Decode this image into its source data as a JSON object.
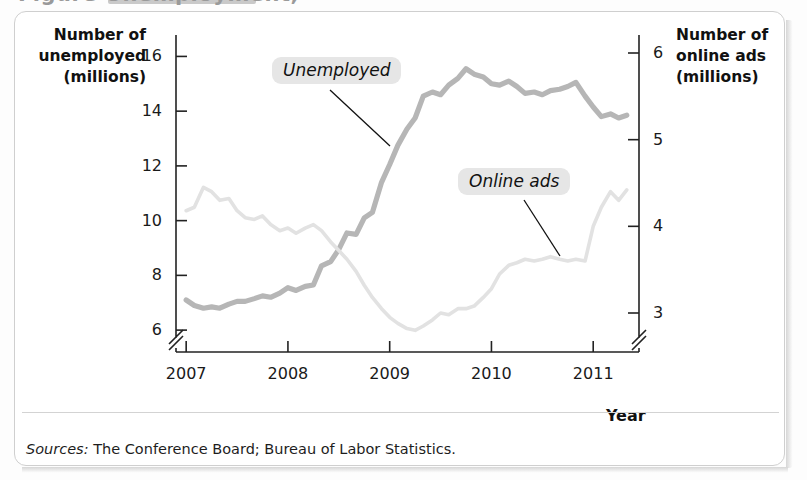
{
  "figure": {
    "cutoff_title": "Figure  Unemployment,",
    "source_label": "Sources:",
    "source_text": "The Conference Board; Bureau of Labor Statistics."
  },
  "chart_data": {
    "type": "line",
    "title": "",
    "xlabel": "Year",
    "ylabel": "Number of unemployed (millions)",
    "y2label": "Number of online ads (millions)",
    "grid": false,
    "legend_position": "inline-callouts",
    "xlim": [
      2006.9,
      2011.45
    ],
    "ylim": [
      5.2,
      16.6
    ],
    "y2lim": [
      2.55,
      6.15
    ],
    "xticks": [
      2007,
      2008,
      2009,
      2010,
      2011
    ],
    "xtick_labels": [
      "2007",
      "2008",
      "2009",
      "2010",
      "2011"
    ],
    "yticks": [
      6,
      8,
      10,
      12,
      14,
      16
    ],
    "ytick_labels": [
      "6",
      "8",
      "10",
      "12",
      "14",
      "16"
    ],
    "y2ticks": [
      3,
      4,
      5,
      6
    ],
    "y2tick_labels": [
      "3",
      "4",
      "5",
      "6"
    ],
    "axis_break_left": true,
    "axis_break_right": true,
    "axis_break_x": true,
    "series": [
      {
        "name": "Unemployed",
        "axis": "left",
        "color": "#b6b6b6",
        "label_text": "Unemployed",
        "x": [
          2007.0,
          2007.08,
          2007.17,
          2007.25,
          2007.33,
          2007.42,
          2007.5,
          2007.58,
          2007.67,
          2007.75,
          2007.83,
          2007.92,
          2008.0,
          2008.08,
          2008.17,
          2008.25,
          2008.33,
          2008.42,
          2008.5,
          2008.58,
          2008.67,
          2008.75,
          2008.83,
          2008.92,
          2009.0,
          2009.08,
          2009.17,
          2009.25,
          2009.33,
          2009.42,
          2009.5,
          2009.58,
          2009.67,
          2009.75,
          2009.83,
          2009.92,
          2010.0,
          2010.08,
          2010.17,
          2010.25,
          2010.33,
          2010.42,
          2010.5,
          2010.58,
          2010.67,
          2010.75,
          2010.83,
          2010.92,
          2011.0,
          2011.08,
          2011.17,
          2011.25,
          2011.33
        ],
        "y": [
          7.1,
          6.9,
          6.8,
          6.85,
          6.8,
          6.95,
          7.05,
          7.05,
          7.15,
          7.25,
          7.2,
          7.35,
          7.55,
          7.45,
          7.6,
          7.65,
          8.35,
          8.5,
          8.95,
          9.55,
          9.5,
          10.1,
          10.3,
          11.4,
          12.05,
          12.75,
          13.35,
          13.75,
          14.55,
          14.7,
          14.6,
          14.95,
          15.2,
          15.55,
          15.35,
          15.25,
          15.0,
          14.95,
          15.1,
          14.9,
          14.65,
          14.7,
          14.6,
          14.75,
          14.8,
          14.9,
          15.05,
          14.55,
          14.15,
          13.8,
          13.9,
          13.75,
          13.85
        ]
      },
      {
        "name": "Online ads",
        "axis": "right",
        "color": "#e2e2e2",
        "label_text": "Online ads",
        "x": [
          2007.0,
          2007.08,
          2007.17,
          2007.25,
          2007.33,
          2007.42,
          2007.5,
          2007.58,
          2007.67,
          2007.75,
          2007.83,
          2007.92,
          2008.0,
          2008.08,
          2008.17,
          2008.25,
          2008.33,
          2008.42,
          2008.5,
          2008.58,
          2008.67,
          2008.75,
          2008.83,
          2008.92,
          2009.0,
          2009.08,
          2009.17,
          2009.25,
          2009.33,
          2009.42,
          2009.5,
          2009.58,
          2009.67,
          2009.75,
          2009.83,
          2009.92,
          2010.0,
          2010.08,
          2010.17,
          2010.25,
          2010.33,
          2010.42,
          2010.5,
          2010.58,
          2010.67,
          2010.75,
          2010.83,
          2010.92,
          2011.0,
          2011.08,
          2011.17,
          2011.25,
          2011.33
        ],
        "y": [
          4.18,
          4.22,
          4.45,
          4.4,
          4.3,
          4.32,
          4.18,
          4.1,
          4.08,
          4.12,
          4.02,
          3.95,
          3.98,
          3.92,
          3.98,
          4.02,
          3.95,
          3.82,
          3.72,
          3.62,
          3.48,
          3.32,
          3.18,
          3.05,
          2.95,
          2.88,
          2.82,
          2.8,
          2.85,
          2.92,
          3.0,
          2.98,
          3.05,
          3.05,
          3.08,
          3.18,
          3.28,
          3.45,
          3.55,
          3.58,
          3.62,
          3.6,
          3.62,
          3.65,
          3.62,
          3.6,
          3.62,
          3.6,
          4.0,
          4.22,
          4.4,
          4.3,
          4.42
        ]
      }
    ],
    "annotations": [
      {
        "text": "Unemployed",
        "x": 2007.9,
        "y": 15.6,
        "leader_to": {
          "x": 2008.85,
          "y": 12.3
        }
      },
      {
        "text": "Online ads",
        "x": 2009.5,
        "y": 11.6,
        "leader_to": {
          "x": 2010.25,
          "y": 8.55
        }
      }
    ]
  }
}
